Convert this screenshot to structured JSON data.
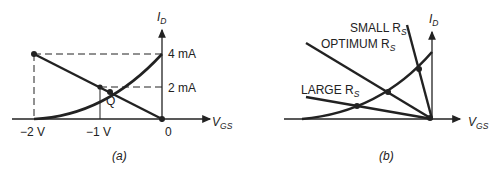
{
  "panel_a": {
    "caption": "(a)",
    "y_axis_label": "I",
    "y_axis_sub": "D",
    "x_axis_label": "V",
    "x_axis_sub": "GS",
    "tick_4ma": "4 mA",
    "tick_2ma": "2 mA",
    "tick_m2v": "−2 V",
    "tick_m1v": "−1 V",
    "tick_0": "0",
    "q_label": "Q"
  },
  "panel_b": {
    "caption": "(b)",
    "y_axis_label": "I",
    "y_axis_sub": "D",
    "x_axis_label": "V",
    "x_axis_sub": "GS",
    "small_rs": "SMALL R",
    "optimum_rs": "OPTIMUM R",
    "large_rs": "LARGE R",
    "rs_sub": "S"
  },
  "colors": {
    "ink": "#222222",
    "background": "#ffffff"
  }
}
